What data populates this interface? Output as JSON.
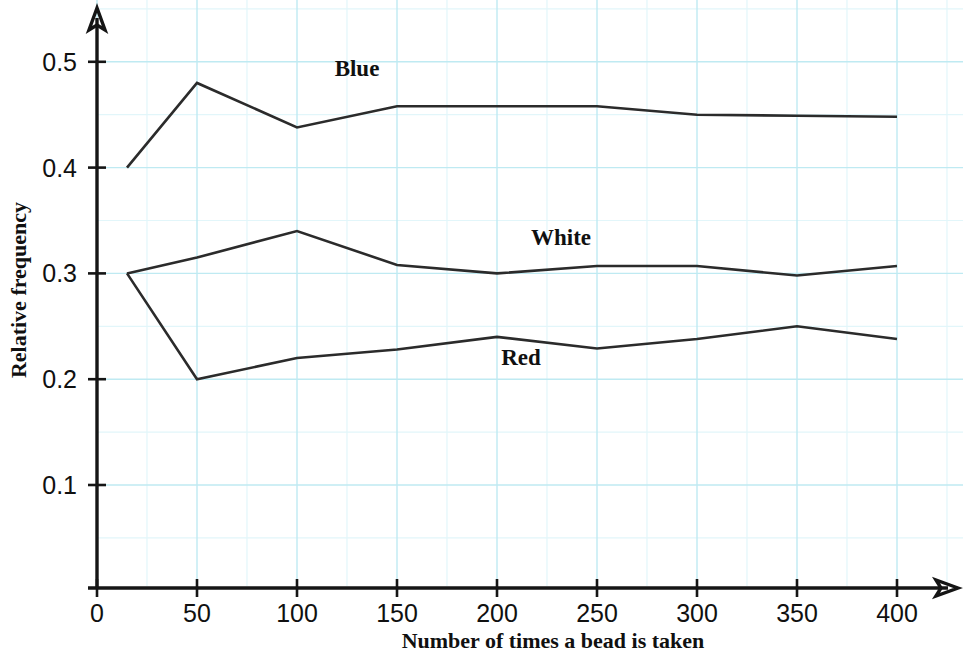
{
  "chart_data": {
    "type": "line",
    "title": "",
    "xlabel": "Number of times a bead is taken",
    "ylabel": "Relative frequency",
    "x": [
      15,
      50,
      100,
      150,
      200,
      250,
      300,
      350,
      400
    ],
    "xticks": [
      0,
      50,
      100,
      150,
      200,
      250,
      300,
      350,
      400
    ],
    "xtick_labels": [
      "0",
      "50",
      "100",
      "150",
      "200",
      "250",
      "300",
      "350",
      "400"
    ],
    "yticks": [
      0.1,
      0.2,
      0.3,
      0.4,
      0.5
    ],
    "ytick_labels": [
      "0.1",
      "0.2",
      "0.3",
      "0.4",
      "0.5"
    ],
    "xlim": [
      0,
      430
    ],
    "ylim": [
      0,
      0.55
    ],
    "grid": true,
    "grid_color": "#bfeaf2",
    "grid_minor_color": "#e2f6fa",
    "line_color": "#2b2b2b",
    "legend_position": "inline-labels",
    "series": [
      {
        "name": "Blue",
        "label": "Blue",
        "label_x": 130,
        "label_y": 0.487,
        "values": [
          0.4,
          0.48,
          0.438,
          0.458,
          0.458,
          0.458,
          0.45,
          0.449,
          0.448
        ]
      },
      {
        "name": "White",
        "label": "White",
        "label_x": 232,
        "label_y": 0.327,
        "values": [
          0.3,
          0.315,
          0.34,
          0.308,
          0.3,
          0.307,
          0.307,
          0.298,
          0.307
        ]
      },
      {
        "name": "Red",
        "label": "Red",
        "label_x": 212,
        "label_y": 0.213,
        "values": [
          0.3,
          0.2,
          0.22,
          0.228,
          0.24,
          0.229,
          0.238,
          0.25,
          0.238
        ]
      }
    ]
  },
  "axes": {
    "x_title": "Number of times a bead is taken",
    "y_title": "Relative frequency",
    "origin_label": "0"
  }
}
